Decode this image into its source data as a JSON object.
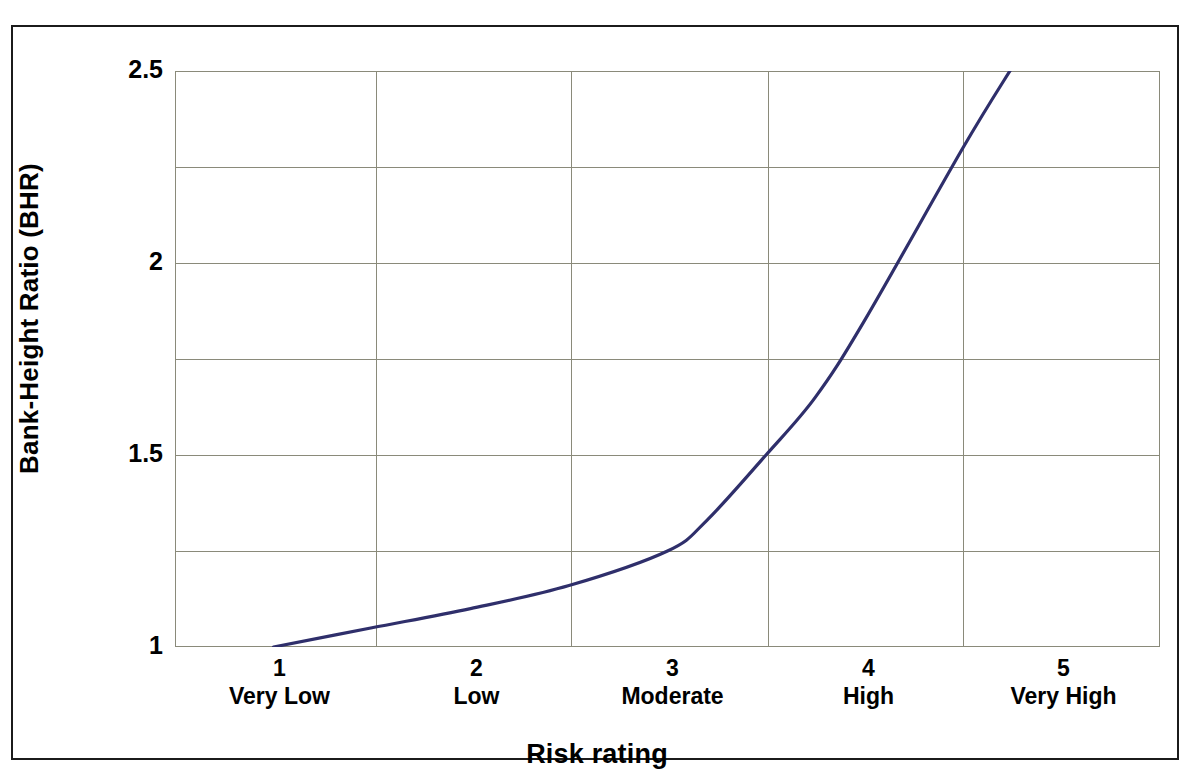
{
  "chart_data": {
    "type": "line",
    "title": "",
    "xlabel": "Risk rating",
    "ylabel": "Bank-Height Ratio (BHR)",
    "xlim": [
      0.5,
      5.5
    ],
    "ylim": [
      1,
      2.5
    ],
    "grid": true,
    "legend": "none",
    "y_ticks": [
      "2.5",
      "2",
      "1.5",
      "1"
    ],
    "y_tick_values": [
      2.5,
      2.0,
      1.5,
      1.0
    ],
    "y_gridline_values": [
      2.5,
      2.25,
      2.0,
      1.75,
      1.5,
      1.25,
      1.0
    ],
    "x_categories": [
      {
        "num": "1",
        "name": "Very Low"
      },
      {
        "num": "2",
        "name": "Low"
      },
      {
        "num": "3",
        "name": "Moderate"
      },
      {
        "num": "4",
        "name": "High"
      },
      {
        "num": "5",
        "name": "Very High"
      }
    ],
    "series": [
      {
        "name": "Bank-Height Ratio",
        "color": "#2f2f6b",
        "x": [
          1.0,
          1.5,
          2.0,
          2.5,
          3.0,
          3.2,
          3.5,
          3.75,
          4.0,
          4.5,
          4.75
        ],
        "values": [
          1.0,
          1.05,
          1.1,
          1.16,
          1.25,
          1.33,
          1.5,
          1.65,
          1.85,
          2.3,
          2.51
        ]
      }
    ]
  },
  "axes": {
    "y_title": "Bank-Height Ratio (BHR)",
    "x_title": "Risk rating"
  }
}
